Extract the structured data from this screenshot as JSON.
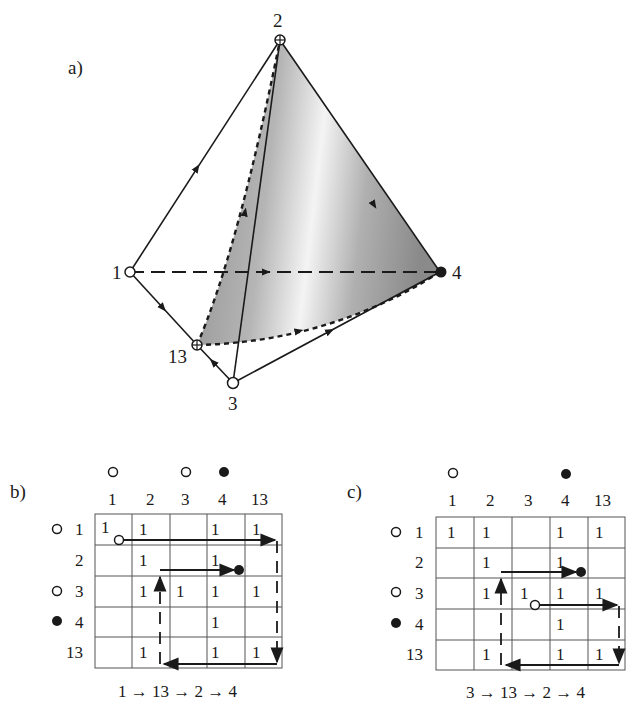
{
  "panel_a": {
    "label": "a)",
    "vertices": {
      "v1": {
        "label": "1",
        "marker": "open-circle"
      },
      "v2": {
        "label": "2",
        "marker": "circled-plus"
      },
      "v3": {
        "label": "3",
        "marker": "open-circle"
      },
      "v4": {
        "label": "4",
        "marker": "filled-circle"
      },
      "v13": {
        "label": "13",
        "marker": "circled-plus"
      }
    },
    "edges": [
      {
        "from": "1",
        "to": "2",
        "style": "solid",
        "arrow": true
      },
      {
        "from": "1",
        "to": "13",
        "style": "solid",
        "arrow": true
      },
      {
        "from": "3",
        "to": "13",
        "style": "solid",
        "arrow": true
      },
      {
        "from": "3",
        "to": "4",
        "style": "solid",
        "arrow": true
      },
      {
        "from": "3",
        "to": "2",
        "style": "solid",
        "arrow": false
      },
      {
        "from": "2",
        "to": "4",
        "style": "solid",
        "arrow": true
      },
      {
        "from": "1",
        "to": "4",
        "style": "dashed",
        "arrow": true
      },
      {
        "from": "13",
        "to": "2",
        "style": "dotted-curve",
        "arrow": true
      },
      {
        "from": "13",
        "to": "4",
        "style": "dotted-curve",
        "arrow": true
      }
    ],
    "shaded_face": [
      "13",
      "2",
      "4"
    ]
  },
  "panel_b": {
    "label": "b)",
    "column_headers": [
      "1",
      "2",
      "3",
      "4",
      "13"
    ],
    "column_markers": [
      "open-circle",
      "",
      "open-circle",
      "filled-circle",
      ""
    ],
    "row_headers": [
      "1",
      "2",
      "3",
      "4",
      "13"
    ],
    "row_markers": [
      "open-circle",
      "",
      "open-circle",
      "filled-circle",
      ""
    ],
    "cells": [
      [
        "1",
        "1",
        "",
        "1",
        "1"
      ],
      [
        "",
        "1",
        "",
        "1",
        ""
      ],
      [
        "",
        "1",
        "1",
        "1",
        "1"
      ],
      [
        "",
        "",
        "",
        "1",
        ""
      ],
      [
        "",
        "1",
        "",
        "1",
        "1"
      ]
    ],
    "path_caption": "1 → 13 → 2 → 4"
  },
  "panel_c": {
    "label": "c)",
    "column_headers": [
      "1",
      "2",
      "3",
      "4",
      "13"
    ],
    "column_markers": [
      "open-circle",
      "",
      "",
      "filled-circle",
      ""
    ],
    "row_headers": [
      "1",
      "2",
      "3",
      "4",
      "13"
    ],
    "row_markers": [
      "open-circle",
      "",
      "open-circle",
      "filled-circle",
      ""
    ],
    "cells": [
      [
        "1",
        "1",
        "",
        "1",
        "1"
      ],
      [
        "",
        "1",
        "",
        "1",
        ""
      ],
      [
        "",
        "1",
        "1",
        "1",
        "1"
      ],
      [
        "",
        "",
        "",
        "1",
        ""
      ],
      [
        "",
        "1",
        "",
        "1",
        "1"
      ]
    ],
    "path_caption": "3 → 13 → 2 → 4"
  }
}
